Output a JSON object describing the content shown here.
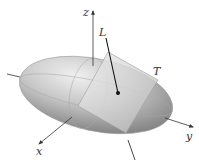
{
  "diagram": {
    "labels": {
      "z_axis": "z",
      "y_axis": "y",
      "x_axis": "x",
      "normal_line": "L",
      "tangent_plane": "T"
    },
    "colors": {
      "ellipsoid_light": "#e6e6e6",
      "ellipsoid_dark": "#8c8c8c",
      "plane_fill": "#d9d9d9",
      "axis": "#333333",
      "normal_line": "#111111"
    }
  }
}
